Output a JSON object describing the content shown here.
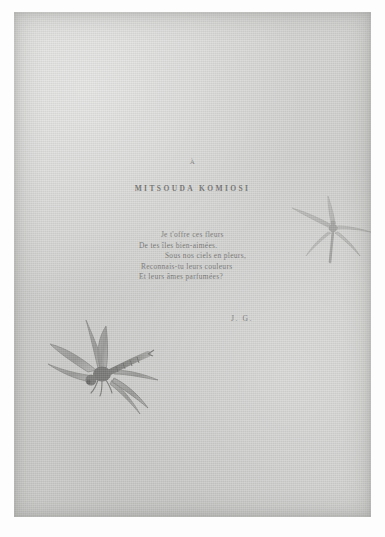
{
  "document": {
    "type": "scanned-book-page",
    "page_background": "#cdcdcb",
    "ink_color": "#6a6a68"
  },
  "dedication": {
    "marker": "À",
    "name": "MITSOUDA KOMIOSI"
  },
  "poem": {
    "lines": [
      "Je t'offre ces fleurs",
      "De tes îles bien-aimées.",
      "Sous nos ciels en pleurs,",
      "Reconnais-tu leurs couleurs",
      "Et leurs âmes parfumées?"
    ]
  },
  "signature": {
    "initials": "J. G."
  },
  "illustrations": [
    {
      "name": "dragonfly-large",
      "description": "large shaded dragonfly with four outspread wings, lower left of page",
      "ink": "#8e8e8c"
    },
    {
      "name": "dragonfly-small",
      "description": "small faint line-drawn dragonfly, upper right of page",
      "ink": "#a8a8a6"
    }
  ]
}
